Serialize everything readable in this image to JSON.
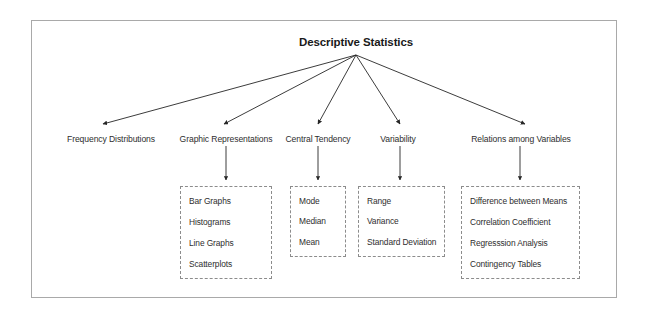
{
  "diagram": {
    "title": "Descriptive Statistics",
    "root": {
      "label": "Descriptive Statistics",
      "x": 356,
      "y": 44
    },
    "hub": {
      "x": 356,
      "y": 55
    },
    "categories": [
      {
        "id": "frequency-distributions",
        "label": "Frequency Distributions",
        "x": 111,
        "y": 139,
        "arrow_tip": {
          "x": 101,
          "y": 126
        },
        "has_children": false,
        "children": []
      },
      {
        "id": "graphic-representations",
        "label": "Graphic Representations",
        "x": 226,
        "y": 139,
        "arrow_tip": {
          "x": 222,
          "y": 126
        },
        "has_children": true,
        "box": {
          "left": 180,
          "top": 186,
          "width": 92,
          "height": 93
        },
        "children": [
          "Bar Graphs",
          "Histograms",
          "Line Graphs",
          "Scatterplots"
        ]
      },
      {
        "id": "central-tendency",
        "label": "Central Tendency",
        "x": 318,
        "y": 139,
        "arrow_tip": {
          "x": 318,
          "y": 126
        },
        "has_children": true,
        "box": {
          "left": 290,
          "top": 186,
          "width": 56,
          "height": 71
        },
        "children": [
          "Mode",
          "Median",
          "Mean"
        ]
      },
      {
        "id": "variability",
        "label": "Variability",
        "x": 398,
        "y": 139,
        "arrow_tip": {
          "x": 400,
          "y": 126
        },
        "has_children": true,
        "box": {
          "left": 358,
          "top": 186,
          "width": 87,
          "height": 71
        },
        "children": [
          "Range",
          "Variance",
          "Standard Deviation"
        ]
      },
      {
        "id": "relations-among-variables",
        "label": "Relations among Variables",
        "x": 519,
        "y": 139,
        "arrow_tip": {
          "x": 527,
          "y": 126
        },
        "has_children": true,
        "box": {
          "left": 461,
          "top": 186,
          "width": 119,
          "height": 93
        },
        "children": [
          "Difference between Means",
          "Correlation Coefficient",
          "Regresssion Analysis",
          "Contingency Tables"
        ]
      }
    ],
    "colors": {
      "frame_border": "#a9a9a9",
      "box_border": "#8c8c8c",
      "connector": "#262626",
      "title_text": "#1a1a1a",
      "body_text": "#2e2e2e",
      "background": "#ffffff"
    }
  }
}
